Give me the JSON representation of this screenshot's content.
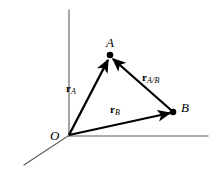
{
  "figure": {
    "kind": "vector-diagram",
    "background_color": "#ffffff",
    "stroke_color": "#000000",
    "axis_color": "#555555",
    "width": 221,
    "height": 170
  },
  "axes": [
    {
      "name": "vertical-axis",
      "x1": 69,
      "y1": 10,
      "x2": 69,
      "y2": 136
    },
    {
      "name": "horizontal-axis",
      "x1": 68,
      "y1": 136,
      "x2": 208,
      "y2": 136
    },
    {
      "name": "oblique-axis",
      "x1": 68,
      "y1": 136,
      "x2": 24,
      "y2": 165
    }
  ],
  "points": [
    {
      "id": "O",
      "label": "O",
      "x": 68,
      "y": 136,
      "label_x": 50,
      "label_y": 129,
      "dot": false
    },
    {
      "id": "A",
      "label": "A",
      "x": 110,
      "y": 55,
      "label_x": 106,
      "label_y": 36,
      "dot": true
    },
    {
      "id": "B",
      "label": "B",
      "x": 173,
      "y": 112,
      "label_x": 181,
      "label_y": 101,
      "dot": true
    }
  ],
  "vectors": [
    {
      "id": "r_A",
      "symbol": "r",
      "subscript": "A",
      "from": "O",
      "to": "A",
      "x1": 69,
      "y1": 135,
      "x2": 108,
      "y2": 60,
      "label_x": 66,
      "label_y": 83
    },
    {
      "id": "r_B",
      "symbol": "r",
      "subscript": "B",
      "from": "O",
      "to": "B",
      "x1": 69,
      "y1": 135,
      "x2": 170,
      "y2": 113,
      "label_x": 110,
      "label_y": 104
    },
    {
      "id": "r_A/B",
      "symbol": "r",
      "subscript": "A/B",
      "from": "B",
      "to": "A",
      "x1": 171,
      "y1": 110,
      "x2": 113,
      "y2": 59,
      "label_x": 142,
      "label_y": 72
    }
  ]
}
